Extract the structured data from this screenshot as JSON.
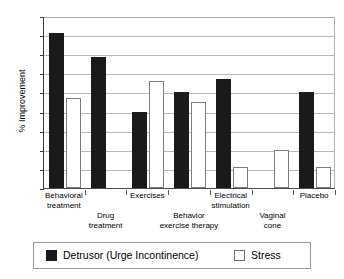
{
  "chart_data": {
    "type": "bar",
    "title": "",
    "xlabel": "",
    "ylabel": "% Improvement",
    "ylim": [
      0,
      90
    ],
    "yticks": [
      0,
      10,
      20,
      30,
      40,
      50,
      60,
      70,
      80,
      90
    ],
    "ytick_labels": [
      "0",
      "10",
      "20",
      "30",
      "40",
      "50",
      "60",
      "70",
      "80",
      "90"
    ],
    "grid": true,
    "legend_position": "bottom",
    "categories": [
      "Behavioral treatment",
      "Drug treatment",
      "Exercises",
      "Behavior exercise therapy",
      "Electrical stimulation",
      "Vaginal cone",
      "Placebo"
    ],
    "category_lines": [
      [
        "Behavioral",
        "treatment"
      ],
      [
        "Drug",
        "treatment"
      ],
      [
        "Exercises"
      ],
      [
        "Behavior",
        "exercise therapy"
      ],
      [
        "Electrical",
        "stimulation"
      ],
      [
        "Vaginal",
        "cone"
      ],
      [
        "Placebo"
      ]
    ],
    "series": [
      {
        "name": "Detrusor (Urge Incontinence)",
        "color": "#1a1a1a",
        "values": [
          81,
          68.5,
          40,
          50,
          57,
          null,
          50
        ]
      },
      {
        "name": "Stress",
        "color": "#ffffff",
        "values": [
          47,
          null,
          56,
          45,
          11,
          20,
          11
        ]
      }
    ]
  },
  "axis": {
    "y_title": "% Improvement"
  },
  "legend": {
    "entries": [
      {
        "label": "Detrusor (Urge Incontinence)",
        "swatch": "filled-black"
      },
      {
        "label": "Stress",
        "swatch": "outlined-white"
      }
    ]
  }
}
